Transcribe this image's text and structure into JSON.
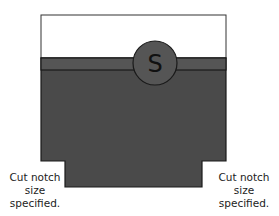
{
  "diagram": {
    "circle_label": "S",
    "left_note": [
      "Cut notch",
      "size",
      "specified."
    ],
    "right_note": [
      "Cut notch",
      "size",
      "specified."
    ],
    "colors": {
      "fill_dark": "#4a4a4a",
      "band": "#555555",
      "outline": "#1a1a1a",
      "top_area": "#ffffff"
    }
  }
}
